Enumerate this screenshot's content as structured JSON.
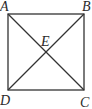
{
  "diagram": {
    "type": "geometry",
    "shape": "square with diagonals",
    "points": {
      "A": {
        "label": "A",
        "x": 8,
        "y": 14
      },
      "B": {
        "label": "B",
        "x": 84,
        "y": 14
      },
      "C": {
        "label": "C",
        "x": 84,
        "y": 90
      },
      "D": {
        "label": "D",
        "x": 8,
        "y": 90
      },
      "E": {
        "label": "E",
        "x": 46,
        "y": 52
      }
    },
    "segments": [
      "AB",
      "BC",
      "CD",
      "DA",
      "AC",
      "BD"
    ],
    "line_color": "#333333"
  }
}
